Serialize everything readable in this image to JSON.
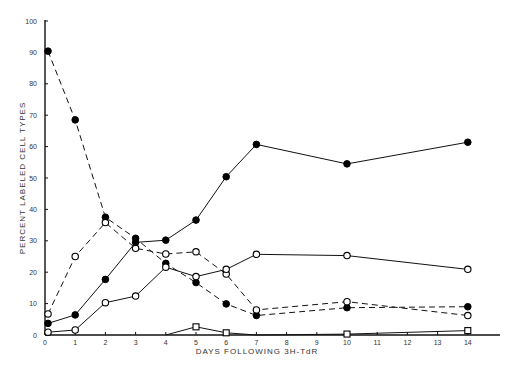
{
  "chart_data": {
    "type": "line",
    "title": "",
    "xlabel": "DAYS FOLLOWING 3H-TdR",
    "ylabel": "PERCENT LABELED CELL TYPES",
    "xlim": [
      0,
      14
    ],
    "ylim": [
      0,
      100
    ],
    "x_ticks": [
      0,
      1,
      2,
      3,
      4,
      5,
      6,
      7,
      8,
      9,
      10,
      11,
      12,
      13,
      14
    ],
    "y_ticks": [
      0,
      10,
      20,
      30,
      40,
      50,
      60,
      70,
      80,
      90,
      100
    ],
    "grid": false,
    "legend": null,
    "series": [
      {
        "name": "filled circles, dashed",
        "marker": "filled-circle",
        "line": "dashed",
        "x": [
          0.1,
          1,
          2,
          3,
          4,
          5,
          6,
          7,
          10,
          14
        ],
        "values": [
          90.4,
          68.5,
          37.5,
          30.8,
          22.8,
          16.7,
          9.9,
          6.2,
          8.7,
          9.0
        ]
      },
      {
        "name": "open circles, dashed",
        "marker": "open-circle",
        "line": "dashed",
        "x": [
          0.1,
          1,
          2,
          3,
          4,
          5,
          6,
          7,
          10,
          14
        ],
        "values": [
          6.7,
          25.0,
          35.8,
          27.6,
          25.8,
          26.5,
          19.4,
          8.0,
          10.6,
          6.2
        ]
      },
      {
        "name": "filled circles, solid",
        "marker": "filled-circle",
        "line": "solid",
        "x": [
          0.1,
          1,
          2,
          3,
          4,
          5,
          6,
          7,
          10,
          14
        ],
        "values": [
          3.7,
          6.4,
          17.7,
          29.5,
          30.2,
          36.6,
          50.4,
          60.7,
          54.5,
          61.4
        ]
      },
      {
        "name": "open circles, solid",
        "marker": "open-circle",
        "line": "solid",
        "x": [
          0.1,
          1,
          2,
          3,
          4,
          5,
          6,
          7,
          10,
          14
        ],
        "values": [
          0.9,
          1.6,
          10.3,
          12.4,
          21.6,
          18.6,
          20.9,
          25.7,
          25.3,
          20.9
        ]
      },
      {
        "name": "open squares, solid",
        "marker": "open-square",
        "line": "solid",
        "x": [
          4,
          5,
          6,
          7,
          10,
          14
        ],
        "values": [
          0,
          2.6,
          0.7,
          0,
          0.3,
          1.4
        ]
      }
    ]
  },
  "axes": {
    "xlabel": "DAYS FOLLOWING 3H-TdR",
    "ylabel": "PERCENT LABELED CELL TYPES"
  }
}
